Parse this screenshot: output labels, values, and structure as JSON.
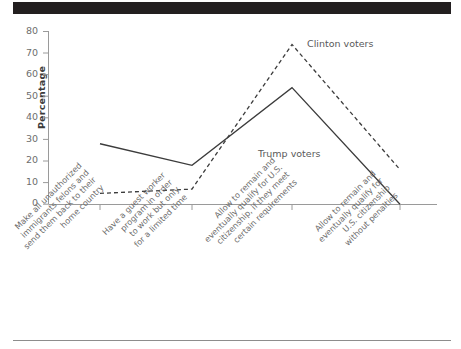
{
  "figure": {
    "header_bar": "black-banner",
    "footer_rule": "divider"
  },
  "chart_data": {
    "type": "line",
    "title": "",
    "subtitle": "",
    "xlabel": "",
    "ylabel": "Percentage",
    "ylim": [
      0,
      80
    ],
    "yticks": [
      0,
      10,
      20,
      30,
      40,
      50,
      60,
      70,
      80
    ],
    "grid": false,
    "legend_position": "inline-annotations",
    "categories": [
      "Make all unauthorized immigrants felons and send them back to their home country",
      "Have a guest worker program in order to work but only for a limited time",
      "Allow to remain and eventually qualify for U.S. citizenship, if they meet certain requirements",
      "Allow to remain and eventually qualify for U.S. citizenship without penalties"
    ],
    "category_lines": [
      [
        "Make all unauthorized",
        "immigrants felons and",
        "send them back to their",
        "home country"
      ],
      [
        "Have a guest worker",
        "program in order",
        "to work but only",
        "for a limited time"
      ],
      [
        "Allow to remain and",
        "eventually qualify for U.S.",
        "citizenship, if they meet",
        "certain requirements"
      ],
      [
        "Allow to remain and",
        "eventually qualify for",
        "U.S. citizenship",
        "without penalties"
      ]
    ],
    "series": [
      {
        "name": "Trump voters",
        "style": "solid",
        "color": "#3c3c3c",
        "values": [
          28,
          18,
          54,
          0
        ]
      },
      {
        "name": "Clinton voters",
        "style": "dashed",
        "color": "#3c3c3c",
        "values": [
          5,
          7,
          74,
          16
        ]
      }
    ],
    "annotations": [
      {
        "text": "Clinton voters",
        "series": "Clinton voters"
      },
      {
        "text": "Trump voters",
        "series": "Trump voters"
      }
    ]
  }
}
